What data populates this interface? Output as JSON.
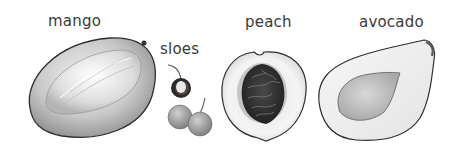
{
  "labels": {
    "mango": "mango",
    "sloes": "sloes",
    "peach": "peach",
    "avocado": "avocado"
  },
  "colors": {
    "background": "#ffffff",
    "text": "#3a3a3a",
    "outline": "#333333"
  }
}
